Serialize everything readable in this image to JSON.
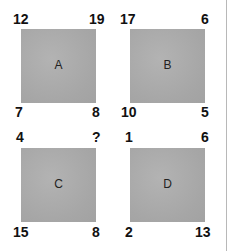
{
  "puzzle": {
    "squares": [
      {
        "label": "A",
        "top_left": "12",
        "top_right": "19",
        "bottom_left": "7",
        "bottom_right": "8"
      },
      {
        "label": "B",
        "top_left": "17",
        "top_right": "6",
        "bottom_left": "10",
        "bottom_right": "5"
      },
      {
        "label": "C",
        "top_left": "4",
        "top_right": "?",
        "bottom_left": "15",
        "bottom_right": "8"
      },
      {
        "label": "D",
        "top_left": "1",
        "top_right": "6",
        "bottom_left": "2",
        "bottom_right": "13"
      }
    ]
  }
}
